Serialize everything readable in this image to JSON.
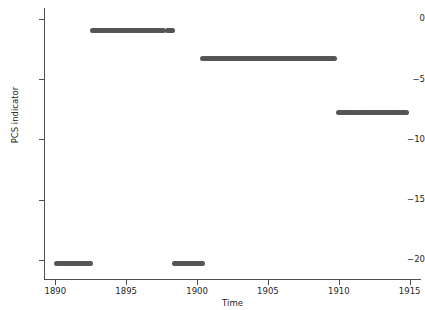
{
  "chart_data": {
    "type": "scatter",
    "title": "",
    "xlabel": "Time",
    "ylabel": "PCS indicator",
    "xlim": [
      1889.2,
      1915.8
    ],
    "ylim": [
      -21.6,
      0.9
    ],
    "xticks": [
      1890,
      1895,
      1900,
      1905,
      1910,
      1915
    ],
    "xticklabels": [
      "1890",
      "1895",
      "1900",
      "1905",
      "1910",
      "1915"
    ],
    "yticks": [
      0,
      -5,
      -10,
      -15,
      -20
    ],
    "yticklabels": [
      "0",
      "-5",
      "-10",
      "-15",
      "-20"
    ],
    "grid": false,
    "legend": null,
    "marker": "circle",
    "marker_color": "#555555",
    "marker_size": 5,
    "series": [
      {
        "name": "PCS indicator",
        "description": "Step-like regime series: densely sampled points forming five flat level segments.",
        "segments": [
          {
            "level": -20.3,
            "x_start": 1890.1,
            "x_end": 1892.5,
            "n_points": 25
          },
          {
            "level": -1.0,
            "x_start": 1892.6,
            "x_end": 1897.6,
            "n_points": 51
          },
          {
            "level": -1.0,
            "x_start": 1897.9,
            "x_end": 1898.3,
            "n_points": 5
          },
          {
            "level": -20.3,
            "x_start": 1898.4,
            "x_end": 1900.4,
            "n_points": 21
          },
          {
            "level": -3.3,
            "x_start": 1900.4,
            "x_end": 1909.7,
            "n_points": 94
          },
          {
            "level": -7.8,
            "x_start": 1910.0,
            "x_end": 1914.8,
            "n_points": 49
          }
        ]
      }
    ]
  }
}
